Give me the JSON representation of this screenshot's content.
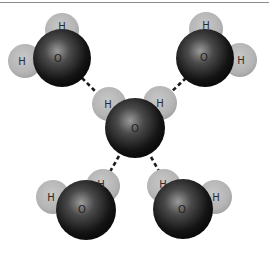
{
  "diagram": {
    "title": "",
    "colors": {
      "hydrogen": "#b9b9b9",
      "oxygen_light": "#8e8e8e",
      "oxygen_dark": "#111111",
      "bond": "#1a1a1a",
      "rule": "#8a8a8a"
    },
    "molecules": [
      {
        "id": "top-left",
        "oxygen_label": "O",
        "hydrogen_labels": [
          "H",
          "H"
        ]
      },
      {
        "id": "top-right",
        "oxygen_label": "O",
        "hydrogen_labels": [
          "H",
          "H"
        ]
      },
      {
        "id": "center",
        "oxygen_label": "O",
        "hydrogen_labels": [
          "H",
          "H"
        ]
      },
      {
        "id": "bottom-left",
        "oxygen_label": "O",
        "hydrogen_labels": [
          "H",
          "H"
        ]
      },
      {
        "id": "bottom-right",
        "oxygen_label": "O",
        "hydrogen_labels": [
          "H",
          "H"
        ]
      }
    ],
    "hydrogen_bonds": [
      {
        "from": "top-left.O",
        "to": "center.H1",
        "style": "dashed"
      },
      {
        "from": "top-right.O",
        "to": "center.H2",
        "style": "dashed"
      },
      {
        "from": "center.O",
        "to": "bottom-left.H2",
        "style": "dashed"
      },
      {
        "from": "center.O",
        "to": "bottom-right.H1",
        "style": "dashed"
      }
    ]
  }
}
